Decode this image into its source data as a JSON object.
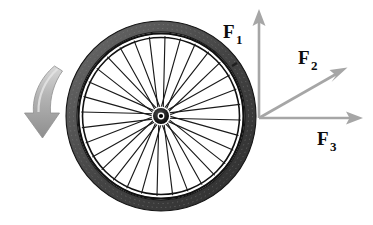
{
  "figure": {
    "background_color": "#ffffff",
    "width": 373,
    "height": 225
  },
  "wheel": {
    "name": "bicycle-wheel",
    "center_x": 161,
    "center_y": 116,
    "tire_outer_radius": 95,
    "tire_inner_radius": 84,
    "rim_outer_radius": 83,
    "rim_inner_radius": 79,
    "hub_outer_radius": 8,
    "hub_inner_radius": 3.6,
    "spoke_count": 32,
    "tire_color": "#4a4a4a",
    "rim_color": "#101010",
    "spoke_color": "#1a1a1a",
    "hub_color": "#0a0a0a"
  },
  "motion_arrow": {
    "name": "rotation-direction-arrow",
    "color": "#9a9a9a",
    "description": "curved downward arrow indicating wheel motion"
  },
  "vectors": {
    "origin_x": 259,
    "origin_y": 118,
    "shaft_color": "#a6a6a6",
    "head_color": "#a6a6a6",
    "items": [
      {
        "id": "F1",
        "label": "F",
        "subscript": "1",
        "tip_x": 259,
        "tip_y": 10,
        "label_x": 223,
        "label_y": 38,
        "sub_x": 237,
        "sub_y": 44,
        "direction": "up"
      },
      {
        "id": "F2",
        "label": "F",
        "subscript": "2",
        "tip_x": 346,
        "tip_y": 67,
        "label_x": 298,
        "label_y": 64,
        "sub_x": 312,
        "sub_y": 70,
        "direction": "up-right-diagonal"
      },
      {
        "id": "F3",
        "label": "F",
        "subscript": "3",
        "tip_x": 362,
        "tip_y": 118,
        "label_x": 317,
        "label_y": 145,
        "sub_x": 331,
        "sub_y": 151,
        "direction": "right"
      }
    ]
  }
}
